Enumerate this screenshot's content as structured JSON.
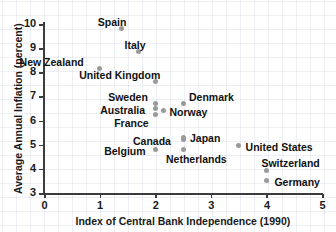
{
  "chart_data": {
    "type": "scatter",
    "title": "",
    "xlabel": "Index of Central Bank Independence (1990)",
    "ylabel": "Average Annual Inflation (percent)",
    "xlim": [
      0,
      5
    ],
    "ylim": [
      3,
      10
    ],
    "xticks": [
      "0",
      "1",
      "2",
      "3",
      "4",
      "5"
    ],
    "yticks": [
      "3",
      "4",
      "5",
      "6",
      "7",
      "8",
      "9",
      "10"
    ],
    "grid": true,
    "legend": "none",
    "marker_color": "#9a9a9a",
    "axis_color": "#3c3c3c",
    "points": [
      {
        "label": "Spain",
        "x": 1.4,
        "y": 9.8,
        "label_dx": -24,
        "label_dy": -13
      },
      {
        "label": "Italy",
        "x": 1.7,
        "y": 8.85,
        "label_dx": -14,
        "label_dy": -13
      },
      {
        "label": "New Zealand",
        "x": 1.0,
        "y": 8.15,
        "label_dx": -80,
        "label_dy": -13
      },
      {
        "label": "United Kingdom",
        "x": 2.0,
        "y": 7.6,
        "label_dx": -76,
        "label_dy": -13
      },
      {
        "label": "Sweden",
        "x": 2.0,
        "y": 6.7,
        "label_dx": -47,
        "label_dy": -13
      },
      {
        "label": "Denmark",
        "x": 2.5,
        "y": 6.7,
        "label_dx": 6,
        "label_dy": -13
      },
      {
        "label": "Australia",
        "x": 2.0,
        "y": 6.5,
        "label_dx": -55,
        "label_dy": -5
      },
      {
        "label": "Norway",
        "x": 2.15,
        "y": 6.4,
        "label_dx": 6,
        "label_dy": -5
      },
      {
        "label": "France",
        "x": 2.0,
        "y": 6.25,
        "label_dx": -41,
        "label_dy": 2
      },
      {
        "label": "Japan",
        "x": 2.5,
        "y": 5.3,
        "label_dx": 7,
        "label_dy": -5
      },
      {
        "label": "Canada",
        "x": 2.5,
        "y": 5.2,
        "label_dx": -50,
        "label_dy": -5
      },
      {
        "label": "United States",
        "x": 3.5,
        "y": 4.95,
        "label_dx": 7,
        "label_dy": -5
      },
      {
        "label": "Belgium",
        "x": 2.0,
        "y": 4.8,
        "label_dx": -51,
        "label_dy": -5
      },
      {
        "label": "Netherlands",
        "x": 2.5,
        "y": 4.8,
        "label_dx": -17,
        "label_dy": 3
      },
      {
        "label": "Switzerland",
        "x": 4.0,
        "y": 3.95,
        "label_dx": -5,
        "label_dy": -13
      },
      {
        "label": "Germany",
        "x": 4.0,
        "y": 3.5,
        "label_dx": 8,
        "label_dy": -5
      }
    ]
  }
}
